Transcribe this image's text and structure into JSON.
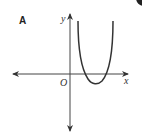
{
  "figure": {
    "label": "A",
    "axes": {
      "x_label": "x",
      "y_label": "y",
      "origin_label": "O"
    },
    "curve": {
      "description": "U-shaped curve opening upward, minimum in positive x below the x-axis, crossing x-axis at two positive x values"
    },
    "colors": {
      "stroke": "#333333",
      "background": "#ffffff"
    }
  }
}
